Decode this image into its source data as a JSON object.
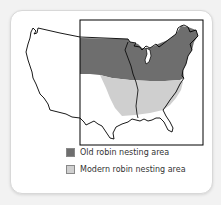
{
  "figure": {
    "type": "map",
    "region": "Contiguous United States",
    "colors": {
      "old_area": "#6e6e6e",
      "modern_area": "#cfcfcf",
      "outline": "#000000",
      "card_bg": "#ffffff"
    }
  },
  "legend": {
    "items": [
      {
        "label": "Old robin nesting area",
        "color": "#6e6e6e"
      },
      {
        "label": "Modern robin nesting area",
        "color": "#cfcfcf"
      }
    ]
  }
}
